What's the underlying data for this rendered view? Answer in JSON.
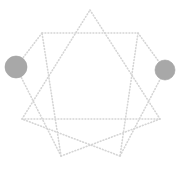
{
  "figure": {
    "title": "Dotted star polygon graph",
    "width": 181,
    "height": 170,
    "background_color": "#ffffff"
  },
  "style": {
    "edge_color": "#d5d5d5",
    "edge_dash_pattern": "0.8 2.2",
    "edge_width": 1.6,
    "edge_linecap": "round",
    "node_fill_color": "#a8a8a8",
    "node_stroke_color": "#a0a0a0",
    "node_radius": 10.5
  },
  "chart_data": {
    "type": "scatter",
    "title": "Dotted star polygon graph",
    "xlabel": "",
    "ylabel": "",
    "grid": false,
    "legend": false,
    "xlim": [
      0,
      181
    ],
    "ylim": [
      0,
      170
    ],
    "vertices": [
      {
        "id": "v0",
        "label": "top",
        "x": 90,
        "y": 10
      },
      {
        "id": "v1",
        "label": "upper-right",
        "x": 138,
        "y": 33
      },
      {
        "id": "v2",
        "label": "right",
        "x": 160,
        "y": 119
      },
      {
        "id": "v3",
        "label": "lower-right",
        "x": 120,
        "y": 156
      },
      {
        "id": "v4",
        "label": "lower-left",
        "x": 61,
        "y": 156
      },
      {
        "id": "v5",
        "label": "left",
        "x": 22,
        "y": 119
      },
      {
        "id": "v6",
        "label": "upper-left",
        "x": 42,
        "y": 33
      }
    ],
    "edges": [
      {
        "from": "v0",
        "to": "v2"
      },
      {
        "from": "v2",
        "to": "v4"
      },
      {
        "from": "v4",
        "to": "v6"
      },
      {
        "from": "v6",
        "to": "v1"
      },
      {
        "from": "v1",
        "to": "v3"
      },
      {
        "from": "v3",
        "to": "v5"
      },
      {
        "from": "v5",
        "to": "v0"
      },
      {
        "from": "v5",
        "to": "v2"
      }
    ],
    "nodes": [
      {
        "id": "n-left",
        "label": "left-node",
        "x": 16,
        "y": 67,
        "r": 11,
        "color": "#a8a8a8"
      },
      {
        "id": "n-right",
        "label": "right-node",
        "x": 165,
        "y": 70,
        "r": 10,
        "color": "#a8a8a8"
      }
    ],
    "node_connectors": [
      {
        "from": "n-left",
        "to_x": 42,
        "to_y": 33
      },
      {
        "from": "n-left",
        "to_x": 61,
        "to_y": 156
      },
      {
        "from": "n-right",
        "to_x": 138,
        "to_y": 33
      },
      {
        "from": "n-right",
        "to_x": 120,
        "to_y": 156
      }
    ]
  }
}
